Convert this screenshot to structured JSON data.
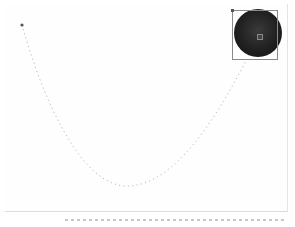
{
  "canvas": {
    "background": "#fefefe",
    "motion_path": {
      "color": "#8c8c8c",
      "start_point": {
        "x": 22,
        "y": 25
      },
      "end_point": {
        "x": 246,
        "y": 61
      },
      "lowest_point": {
        "x": 130,
        "y": 186
      },
      "point_count": 40
    },
    "selected_object": {
      "type": "sphere",
      "color": "#1e1e1e",
      "bounding_box": {
        "x": 232,
        "y": 10,
        "w": 46,
        "h": 50
      }
    }
  },
  "status_bar": {
    "segments": [
      "",
      "",
      "",
      "",
      "",
      ""
    ]
  }
}
